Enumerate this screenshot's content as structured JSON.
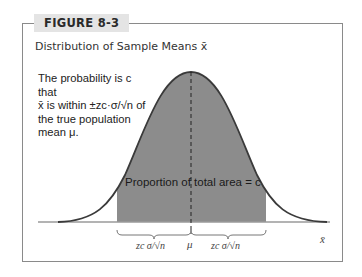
{
  "figure": {
    "label": "FIGURE 8-3",
    "title": "Distribution of Sample Means x̄"
  },
  "annotation": {
    "line1": "The probability is c that",
    "line2": "x̄ is within ±zc·σ/√n of",
    "line3": "the true population",
    "line4": "mean μ."
  },
  "diagram": {
    "area_label": "Proportion of total area = c",
    "left_bracket_label": "zc σ/√n",
    "center_label": "μ",
    "right_bracket_label": "zc σ/√n",
    "axis_label": "x̄",
    "colors": {
      "shade": "#8c8c8c",
      "curve": "#3a3a3a",
      "frame": "#8a8a8a",
      "tab": "#e4e4e4"
    }
  }
}
